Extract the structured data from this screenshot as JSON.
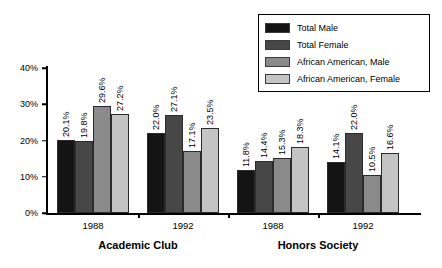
{
  "chart_data": {
    "type": "bar",
    "title": "",
    "xlabel": "",
    "ylabel": "",
    "ylim": [
      0,
      40
    ],
    "ytick_labels": [
      "0%",
      "10%",
      "20%",
      "30%",
      "40%"
    ],
    "ytick_values": [
      0,
      10,
      20,
      30,
      40
    ],
    "grid": false,
    "legend_position": "top-right",
    "group_labels": [
      "Academic Club",
      "Honors Society"
    ],
    "categories": [
      "1988",
      "1992",
      "1988",
      "1992"
    ],
    "series": [
      {
        "name": "Total Male",
        "color": "#141414",
        "values": [
          20.1,
          22.0,
          11.8,
          14.1
        ],
        "labels": [
          "20.1%",
          "22.0%",
          "11.8%",
          "14.1%"
        ]
      },
      {
        "name": "Total Female",
        "color": "#474747",
        "values": [
          19.8,
          27.1,
          14.4,
          22.0
        ],
        "labels": [
          "19.8%",
          "27.1%",
          "14.4%",
          "22.0%"
        ]
      },
      {
        "name": "African American, Male",
        "color": "#8a8a8a",
        "values": [
          29.6,
          17.1,
          15.3,
          10.5
        ],
        "labels": [
          "29.6%",
          "17.1%",
          "15.3%",
          "10.5%"
        ]
      },
      {
        "name": "African American, Female",
        "color": "#c4c4c4",
        "values": [
          27.2,
          23.5,
          18.3,
          16.6
        ],
        "labels": [
          "27.2%",
          "23.5%",
          "18.3%",
          "16.6%"
        ]
      }
    ]
  }
}
